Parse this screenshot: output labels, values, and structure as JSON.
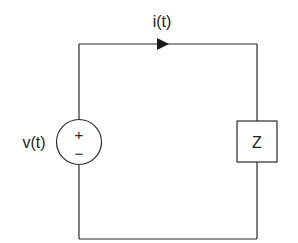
{
  "diagram": {
    "type": "circuit-schematic",
    "title": "",
    "source": {
      "label": "v(t)",
      "kind": "voltage-source",
      "plus_sign": "+",
      "minus_sign": "−"
    },
    "current": {
      "label": "i(t)",
      "direction": "clockwise"
    },
    "load": {
      "label": "Z",
      "kind": "impedance"
    },
    "colors": {
      "line": "#2b2b2b",
      "text": "#222222",
      "background": "#ffffff"
    }
  }
}
